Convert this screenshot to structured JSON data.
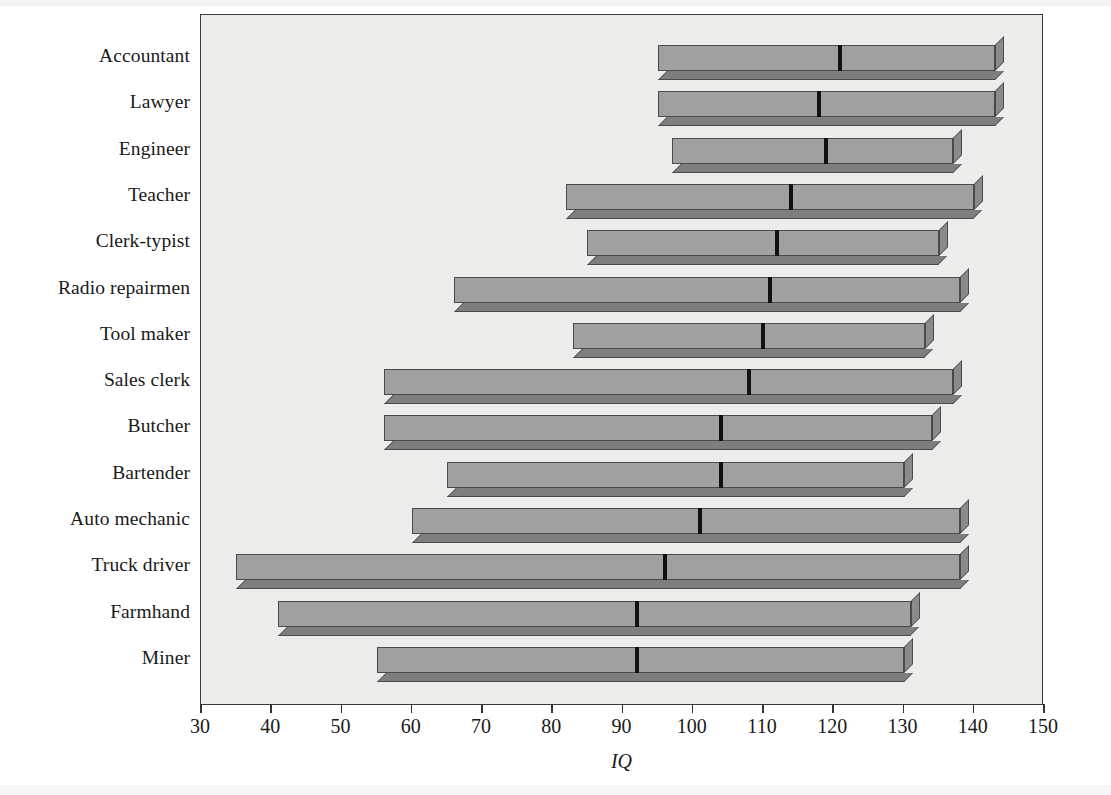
{
  "chart_data": {
    "type": "bar",
    "subtype": "floating-range-bar-with-median",
    "title": "",
    "xlabel": "IQ",
    "ylabel": "",
    "xlim": [
      30,
      150
    ],
    "xticks": [
      30,
      40,
      50,
      60,
      70,
      80,
      90,
      100,
      110,
      120,
      130,
      140,
      150
    ],
    "xtick_labels": [
      "30",
      "40",
      "50",
      "60",
      "70",
      "80",
      "90",
      "100",
      "110",
      "120",
      "130",
      "140",
      "150"
    ],
    "grid": false,
    "legend": null,
    "categories": [
      "Accountant",
      "Lawyer",
      "Engineer",
      "Teacher",
      "Clerk-typist",
      "Radio repairmen",
      "Tool maker",
      "Sales clerk",
      "Butcher",
      "Bartender",
      "Auto mechanic",
      "Truck driver",
      "Farmhand",
      "Miner"
    ],
    "series": [
      {
        "name": "range_low",
        "values": [
          95,
          95,
          97,
          82,
          85,
          66,
          83,
          56,
          56,
          65,
          60,
          35,
          41,
          55
        ]
      },
      {
        "name": "range_high",
        "values": [
          143,
          143,
          137,
          140,
          135,
          138,
          133,
          137,
          134,
          130,
          138,
          138,
          131,
          130
        ]
      },
      {
        "name": "median",
        "values": [
          121,
          118,
          119,
          114,
          112,
          111,
          110,
          108,
          104,
          104,
          101,
          96,
          92,
          92
        ]
      }
    ],
    "colors": {
      "bar_face": "#a0a0a0",
      "bar_side": "#8a8a8a",
      "bar_bottom": "#7e7e7e",
      "bar_outline": "#4a4a4a",
      "median_marker": "#111111",
      "plot_background": "#ececeb",
      "frame": "#3a3a3a",
      "text": "#1a1a1a"
    }
  },
  "axis": {
    "title": "IQ"
  }
}
